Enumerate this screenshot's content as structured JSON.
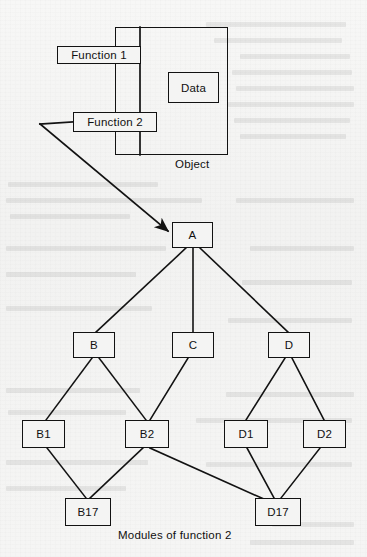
{
  "figure": {
    "caption": "Modules of function 2",
    "object_label": "Object",
    "background_color": "#f4f4f3",
    "ink_color": "#121212"
  },
  "object_diagram": {
    "container_name": "Object",
    "members": [
      {
        "id": "function1",
        "label": "Function 1",
        "kind": "function"
      },
      {
        "id": "function2",
        "label": "Function 2",
        "kind": "function"
      },
      {
        "id": "data",
        "label": "Data",
        "kind": "data"
      }
    ]
  },
  "module_tree": {
    "root": "A",
    "nodes": [
      {
        "id": "A",
        "label": "A",
        "level": 0
      },
      {
        "id": "B",
        "label": "B",
        "level": 1
      },
      {
        "id": "C",
        "label": "C",
        "level": 1
      },
      {
        "id": "D",
        "label": "D",
        "level": 1
      },
      {
        "id": "B1",
        "label": "B1",
        "level": 2
      },
      {
        "id": "B2",
        "label": "B2",
        "level": 2
      },
      {
        "id": "D1",
        "label": "D1",
        "level": 2
      },
      {
        "id": "D2",
        "label": "D2",
        "level": 2
      },
      {
        "id": "B17",
        "label": "B17",
        "level": 3
      },
      {
        "id": "D17",
        "label": "D17",
        "level": 3
      }
    ],
    "edges": [
      {
        "from": "A",
        "to": "B"
      },
      {
        "from": "A",
        "to": "C"
      },
      {
        "from": "A",
        "to": "D"
      },
      {
        "from": "B",
        "to": "B1"
      },
      {
        "from": "B",
        "to": "B2"
      },
      {
        "from": "C",
        "to": "B2"
      },
      {
        "from": "D",
        "to": "D1"
      },
      {
        "from": "D",
        "to": "D2"
      },
      {
        "from": "B1",
        "to": "B17"
      },
      {
        "from": "B2",
        "to": "B17"
      },
      {
        "from": "B2",
        "to": "D17"
      },
      {
        "from": "D1",
        "to": "D17"
      },
      {
        "from": "D2",
        "to": "D17"
      }
    ],
    "pointer_edge": {
      "from": "function2",
      "to": "A",
      "style": "arrow"
    }
  }
}
